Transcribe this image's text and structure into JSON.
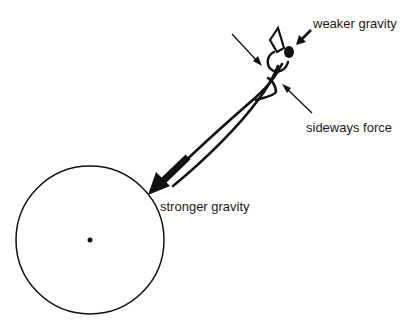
{
  "diagram": {
    "title": "",
    "labels": {
      "weaker": "weaker gravity",
      "sideways": "sideways force",
      "stronger": "stronger gravity"
    },
    "planet": {
      "center": [
        90,
        240
      ],
      "radius": 74
    },
    "colors": {
      "stroke": "#111111",
      "background": "#ffffff"
    }
  }
}
